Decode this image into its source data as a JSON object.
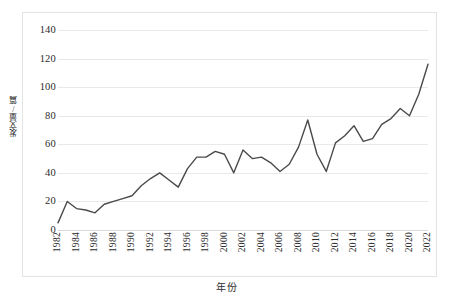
{
  "figure": {
    "background_color": "#ffffff",
    "frame_color": "#e3e3e3",
    "gridline_color": "#e9e9e9",
    "line_color": "#4a4a4a",
    "text_color": "#2b2b2b"
  },
  "axis_titles": {
    "x": "年份",
    "y": "发文量/篇"
  },
  "chart_data": {
    "type": "line",
    "title": "",
    "xlabel": "年份",
    "ylabel": "发文量/篇",
    "xlim": [
      1982,
      2022
    ],
    "ylim": [
      0,
      140
    ],
    "y_ticks": [
      0,
      20,
      40,
      60,
      80,
      100,
      120,
      140
    ],
    "y_tick_labels": [
      "0",
      "20",
      "40",
      "60",
      "80",
      "100",
      "120",
      "140"
    ],
    "x_tick_labels": [
      "1982",
      "1984",
      "1986",
      "1988",
      "1990",
      "1992",
      "1994",
      "1996",
      "1998",
      "2000",
      "2002",
      "2004",
      "2006",
      "2008",
      "2010",
      "2012",
      "2014",
      "2016",
      "2018",
      "2020",
      "2022"
    ],
    "x_tick_values": [
      1982,
      1984,
      1986,
      1988,
      1990,
      1992,
      1994,
      1996,
      1998,
      2000,
      2002,
      2004,
      2006,
      2008,
      2010,
      2012,
      2014,
      2016,
      2018,
      2020,
      2022
    ],
    "grid": true,
    "grid_axis": "y",
    "legend": false,
    "legend_position": "none",
    "x": [
      1982,
      1983,
      1984,
      1985,
      1986,
      1987,
      1988,
      1989,
      1990,
      1991,
      1992,
      1993,
      1994,
      1995,
      1996,
      1997,
      1998,
      1999,
      2000,
      2001,
      2002,
      2003,
      2004,
      2005,
      2006,
      2007,
      2008,
      2009,
      2010,
      2011,
      2012,
      2013,
      2014,
      2015,
      2016,
      2017,
      2018,
      2019,
      2020,
      2021,
      2022
    ],
    "values": [
      5,
      20,
      15,
      14,
      12,
      18,
      20,
      22,
      24,
      31,
      36,
      40,
      35,
      30,
      43,
      51,
      51,
      55,
      53,
      40,
      56,
      50,
      51,
      47,
      41,
      46,
      58,
      77,
      53,
      41,
      61,
      66,
      73,
      62,
      64,
      74,
      78,
      85,
      80,
      95,
      116
    ],
    "series": [
      {
        "name": "发文量",
        "values": [
          5,
          20,
          15,
          14,
          12,
          18,
          20,
          22,
          24,
          31,
          36,
          40,
          35,
          30,
          43,
          51,
          51,
          55,
          53,
          40,
          56,
          50,
          51,
          47,
          41,
          46,
          58,
          77,
          53,
          41,
          61,
          66,
          73,
          62,
          64,
          74,
          78,
          85,
          80,
          95,
          116
        ],
        "color": "#4a4a4a"
      }
    ]
  }
}
